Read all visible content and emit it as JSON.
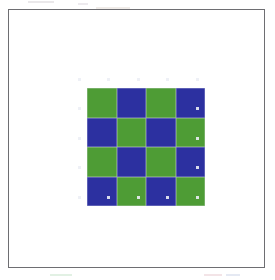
{
  "figure": {
    "background_color": "#ffffff",
    "frame_color": "#6e6e72",
    "frame_label": "figure border"
  },
  "chart_data": {
    "type": "heatmap",
    "title": "",
    "subtitle": "",
    "xlabel": "",
    "ylabel": "",
    "grid": true,
    "legend_position": "none",
    "rows": 4,
    "cols": 4,
    "cell_size_px": 29,
    "origin_px": [
      78,
      78
    ],
    "colors": {
      "green": "#4e9c35",
      "blue": "#2c30a0",
      "separator": "#e2e4ec"
    },
    "value_labels": {
      "0": "green",
      "1": "blue"
    },
    "tick_labels": {
      "x": [
        "",
        "",
        "",
        ""
      ],
      "y": [
        "",
        "",
        "",
        ""
      ]
    },
    "cells": [
      [
        "green",
        "blue",
        "green",
        "blue"
      ],
      [
        "blue",
        "green",
        "blue",
        "green"
      ],
      [
        "green",
        "blue",
        "green",
        "blue"
      ],
      [
        "blue",
        "green",
        "blue",
        "green"
      ]
    ],
    "values": [
      [
        0,
        1,
        0,
        1
      ],
      [
        1,
        0,
        1,
        0
      ],
      [
        0,
        1,
        0,
        1
      ],
      [
        1,
        0,
        1,
        0
      ]
    ],
    "annotations": []
  }
}
